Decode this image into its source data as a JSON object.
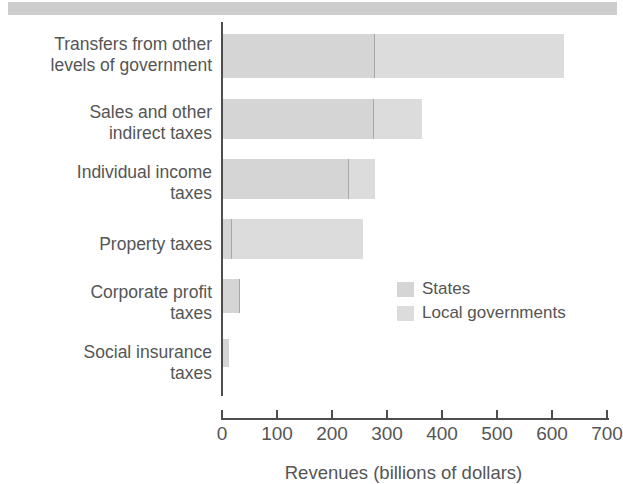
{
  "chart_data": {
    "type": "bar",
    "orientation": "horizontal",
    "stacked": true,
    "title": "",
    "xlabel": "Revenues (billions of dollars)",
    "ylabel": "",
    "xlim": [
      0,
      700
    ],
    "xticks": [
      0,
      100,
      200,
      300,
      400,
      500,
      600,
      700
    ],
    "grid": false,
    "legend_position": "inside-right",
    "categories": [
      "Transfers from other\nlevels of government",
      "Sales and other\nindirect taxes",
      "Individual income\ntaxes",
      "Property taxes",
      "Corporate profit\ntaxes",
      "Social insurance\ntaxes"
    ],
    "series": [
      {
        "name": "States",
        "color": "#d5d5d5",
        "values": [
          275,
          272,
          227,
          14,
          29,
          10
        ]
      },
      {
        "name": "Local governments",
        "color": "#dcdcdc",
        "values": [
          345,
          90,
          50,
          241,
          1,
          0
        ]
      }
    ],
    "totals": [
      620,
      362,
      277,
      255,
      30,
      10
    ]
  },
  "legend": {
    "items": [
      {
        "label": "States",
        "color": "#d5d5d5"
      },
      {
        "label": "Local governments",
        "color": "#dcdcdc"
      }
    ]
  },
  "axis": {
    "x_title": "Revenues (billions of dollars)",
    "x_tick_labels": [
      "0",
      "100",
      "200",
      "300",
      "400",
      "500",
      "600",
      "700"
    ]
  },
  "colors": {
    "bar_states": "#d5d5d5",
    "bar_local": "#dcdcdc",
    "axis": "#4d4d4d",
    "text": "#555555",
    "top_band": "#c9c9c9",
    "background": "#ffffff"
  }
}
